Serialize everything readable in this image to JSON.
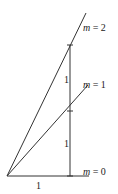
{
  "diagram": {
    "lines": [
      {
        "label_var": "m",
        "label_eq": " = 2",
        "slope": 2
      },
      {
        "label_var": "m",
        "label_eq": " = 1",
        "slope": 1
      },
      {
        "label_var": "m",
        "label_eq": " = 0",
        "slope": 0
      }
    ],
    "run_label": "1",
    "rise_labels": [
      "1",
      "1"
    ],
    "colors": {
      "stroke": "#333333",
      "background": "#ffffff"
    }
  }
}
